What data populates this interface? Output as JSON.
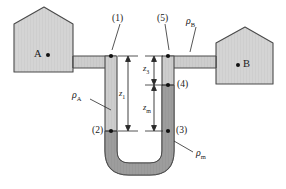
{
  "figure": {
    "type": "differential-u-tube-manometer",
    "vessels": [
      {
        "id": "A",
        "label": "A",
        "dot": true
      },
      {
        "id": "B",
        "label": "B",
        "dot": true
      }
    ],
    "points": [
      {
        "id": "1",
        "label": "(1)"
      },
      {
        "id": "2",
        "label": "(2)"
      },
      {
        "id": "3",
        "label": "(3)"
      },
      {
        "id": "4",
        "label": "(4)"
      },
      {
        "id": "5",
        "label": "(5)"
      }
    ],
    "densities": [
      {
        "id": "rho_A",
        "symbol": "ρ",
        "sub": "A"
      },
      {
        "id": "rho_B",
        "symbol": "ρ",
        "sub": "B"
      },
      {
        "id": "rho_m",
        "symbol": "ρ",
        "sub": "m"
      }
    ],
    "dimensions": [
      {
        "id": "z1",
        "symbol": "z",
        "sub": "1"
      },
      {
        "id": "z3",
        "symbol": "z",
        "sub": "3"
      },
      {
        "id": "zm",
        "symbol": "z",
        "sub": "m"
      }
    ],
    "colors": {
      "vessel_fill": "#d2d2d2",
      "outline": "#4a4a4a",
      "light_fluid": "#cfcfcf",
      "heavy_fluid": "#9a9a9a",
      "text": "#1a1a1a"
    }
  }
}
